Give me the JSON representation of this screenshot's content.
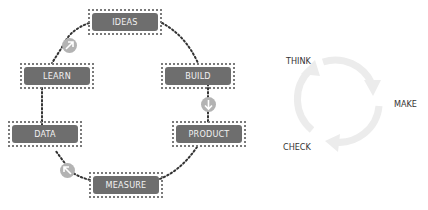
{
  "left_diagram": {
    "nodes": [
      {
        "id": "ideas",
        "label": "IDEAS"
      },
      {
        "id": "build",
        "label": "BUILD"
      },
      {
        "id": "product",
        "label": "PRODUCT"
      },
      {
        "id": "measure",
        "label": "MEASURE"
      },
      {
        "id": "data",
        "label": "DATA"
      },
      {
        "id": "learn",
        "label": "LEARN"
      }
    ],
    "badges": [
      {
        "id": "learn-to-ideas",
        "icon": "arrow-up-right-icon"
      },
      {
        "id": "build-to-product",
        "icon": "arrow-down-icon"
      },
      {
        "id": "measure-to-data",
        "icon": "arrow-up-left-icon"
      }
    ],
    "colors": {
      "node_fill": "#6e6e6e",
      "node_text": "#f2f2f2",
      "dotted_border": "#7a7a7a",
      "connector": "#333333",
      "badge": "#b3b3b3"
    }
  },
  "right_diagram": {
    "labels": {
      "think": "THINK",
      "make": "MAKE",
      "check": "CHECK"
    },
    "colors": {
      "arrow": "#e8e8e8",
      "text": "#333333"
    }
  }
}
